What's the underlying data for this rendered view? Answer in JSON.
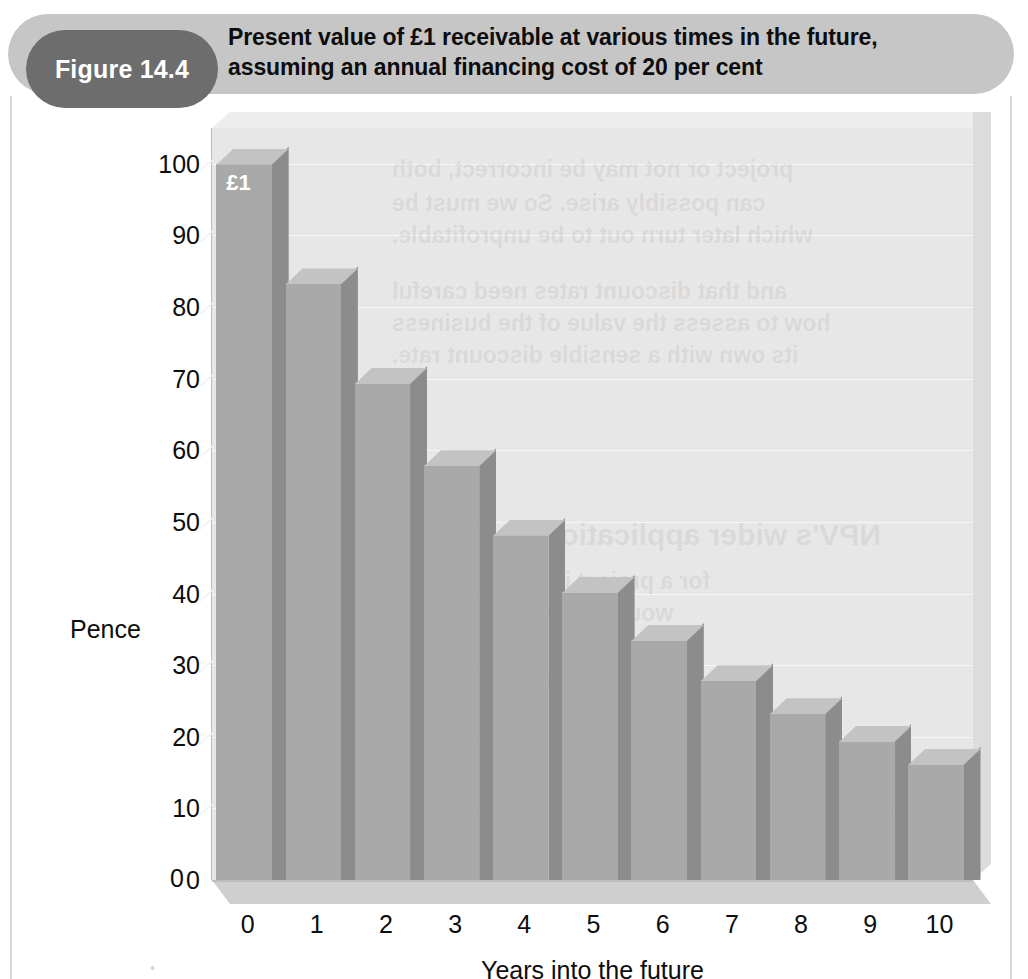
{
  "header": {
    "badge_label": "Figure 14.4",
    "title_line1": "Present value of £1 receivable at various times in the future,",
    "title_line2": "assuming an annual financing cost of 20 per cent",
    "badge_color": "#6d6d6d",
    "banner_color": "#c6c6c6"
  },
  "chart_data": {
    "type": "bar",
    "title": "Present value of £1 receivable at various times in the future, assuming an annual financing cost of 20 per cent",
    "xlabel": "Years into the future",
    "ylabel": "Pence",
    "categories": [
      "0",
      "1",
      "2",
      "3",
      "4",
      "5",
      "6",
      "7",
      "8",
      "9",
      "10"
    ],
    "values": [
      100,
      83.3,
      69.4,
      57.9,
      48.2,
      40.2,
      33.5,
      27.9,
      23.3,
      19.4,
      16.2
    ],
    "series": [
      {
        "name": "Present value of £1",
        "values": [
          100,
          83.3,
          69.4,
          57.9,
          48.2,
          40.2,
          33.5,
          27.9,
          23.3,
          19.4,
          16.2
        ]
      }
    ],
    "ylim": [
      0,
      105
    ],
    "yticks": [
      0,
      10,
      20,
      30,
      40,
      50,
      60,
      70,
      80,
      90,
      100
    ],
    "ytick_labels": [
      "0",
      "10",
      "20",
      "30",
      "40",
      "50",
      "60",
      "70",
      "80",
      "90",
      "100"
    ],
    "xtick_labels": [
      "0",
      "1",
      "2",
      "3",
      "4",
      "5",
      "6",
      "7",
      "8",
      "9",
      "10"
    ],
    "grid": true,
    "legend": "none",
    "annotations": [
      {
        "text": "£1",
        "category": "0",
        "value": 100
      }
    ],
    "style": "3d-column",
    "colors": {
      "bar_front": "#a9a9a9",
      "bar_side": "#8c8c8c",
      "bar_top": "#c3c3c3",
      "plot_wall": "#e7e7e7",
      "floor": "#cfcfcf",
      "gridline": "#f7f7f7"
    }
  },
  "axes": {
    "y_label": "Pence",
    "x_label": "Years into the future",
    "origin_label": "0"
  },
  "bar_annotation": "£1",
  "page_bleed_text": "•                                                        ",
  "ghost_lines": [
    {
      "text": "project or not may be incorrect, both",
      "x": 180,
      "y": 28
    },
    {
      "text": "can possibly arise. So we must be",
      "x": 180,
      "y": 62
    },
    {
      "text": "which later turn out to be unprofitable.",
      "x": 180,
      "y": 94
    },
    {
      "text": "and that discount rates need careful",
      "x": 180,
      "y": 150
    },
    {
      "text": "how to assess the value of the business",
      "x": 180,
      "y": 182
    },
    {
      "text": "its own with a sensible discount rate.",
      "x": 180,
      "y": 214
    },
    {
      "text": "NPV's wider application",
      "x": 330,
      "y": 390
    },
    {
      "text": "for a project is a good way of",
      "x": 180,
      "y": 440
    },
    {
      "text": "would arise in attaching a",
      "x": 180,
      "y": 472
    },
    {
      "text": "future cash flows",
      "x": 180,
      "y": 504
    },
    {
      "text": "that we have seen",
      "x": 180,
      "y": 536
    },
    {
      "text": "used. Employing",
      "x": 180,
      "y": 568
    }
  ]
}
